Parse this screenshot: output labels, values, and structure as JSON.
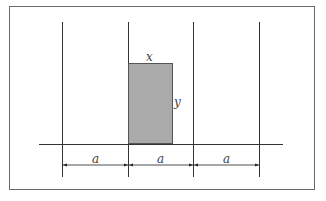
{
  "diagram": {
    "frame": {
      "x": 9,
      "y": 6,
      "width": 306,
      "height": 184,
      "stroke": "#6a6a6a"
    },
    "vertical_lines_x": [
      62,
      128,
      193,
      259
    ],
    "vertical_lines_y": [
      22,
      177
    ],
    "baseline": {
      "x1": 39,
      "x2": 283,
      "y": 144
    },
    "rectangle": {
      "x": 128,
      "y": 63,
      "width": 45,
      "height": 81,
      "fill": "#aaaaaa",
      "stroke": "#555555"
    },
    "labels": {
      "top": "x",
      "side": "y",
      "spacing": [
        "a",
        "a",
        "a"
      ]
    },
    "dimension_arrow_y": 165
  }
}
